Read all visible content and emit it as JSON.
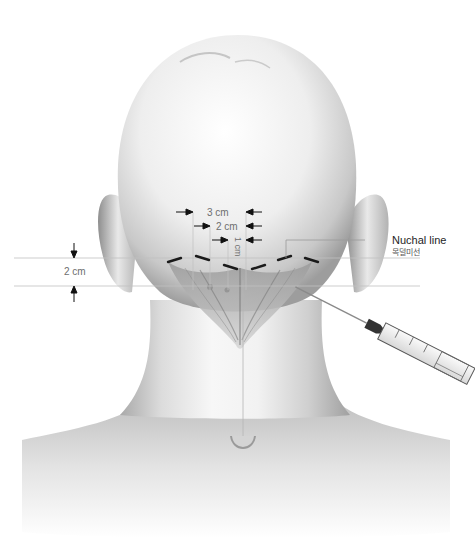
{
  "figure": {
    "type": "medical-illustration",
    "colors": {
      "background": "#ffffff",
      "skin_light": "#f4f4f4",
      "skin_shadow": "#9a9a9a",
      "guide_line": "#b5b5b5",
      "dash_mark": "#1a1a1a",
      "text_dim": "#6e6e6e",
      "text_dark": "#1e1e1e"
    }
  },
  "measurements": {
    "horizontal_3cm": "3 cm",
    "horizontal_2cm": "2 cm",
    "vertical_1cm": "1 cm",
    "vertical_2cm": "2 cm"
  },
  "callout": {
    "label_en": "Nuchal line",
    "label_kr": "목덜미선"
  },
  "instrument": {
    "name": "syringe",
    "scale_marks": [
      "1",
      "2",
      "3",
      "4",
      "5",
      "6"
    ]
  }
}
